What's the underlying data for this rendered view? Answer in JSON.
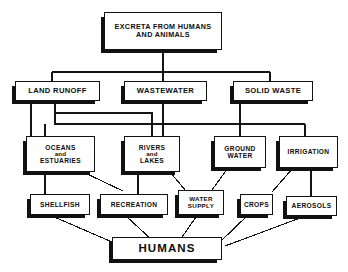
{
  "diagram": {
    "ink_color": "#111111",
    "background_color": "#ffffff",
    "levels": [
      {
        "level": 1,
        "nodes": [
          {
            "id": "excreta",
            "lines": [
              "EXCRETA FROM HUMANS",
              "AND ANIMALS"
            ]
          }
        ]
      },
      {
        "level": 2,
        "nodes": [
          {
            "id": "land_runoff",
            "lines": [
              "LAND RUNOFF"
            ]
          },
          {
            "id": "wastewater",
            "lines": [
              "WASTEWATER"
            ]
          },
          {
            "id": "solid_waste",
            "lines": [
              "SOLID WASTE"
            ]
          }
        ]
      },
      {
        "level": 3,
        "nodes": [
          {
            "id": "oceans",
            "lines": [
              "OCEANS",
              "and",
              "ESTUARIES"
            ]
          },
          {
            "id": "rivers",
            "lines": [
              "RIVERS",
              "and",
              "LAKES"
            ]
          },
          {
            "id": "ground_water",
            "lines": [
              "GROUND",
              "WATER"
            ]
          },
          {
            "id": "irrigation",
            "lines": [
              "IRRIGATION"
            ]
          }
        ]
      },
      {
        "level": 4,
        "nodes": [
          {
            "id": "shellfish",
            "lines": [
              "SHELLFISH"
            ]
          },
          {
            "id": "recreation",
            "lines": [
              "RECREATION"
            ]
          },
          {
            "id": "water_supply",
            "lines": [
              "WATER",
              "SUPPLY"
            ]
          },
          {
            "id": "crops",
            "lines": [
              "CROPS"
            ]
          },
          {
            "id": "aerosols",
            "lines": [
              "AEROSOLS"
            ]
          }
        ]
      },
      {
        "level": 5,
        "nodes": [
          {
            "id": "humans",
            "lines": [
              "HUMANS"
            ]
          }
        ]
      }
    ],
    "edges": [
      {
        "from": "excreta",
        "to": "land_runoff"
      },
      {
        "from": "excreta",
        "to": "wastewater"
      },
      {
        "from": "excreta",
        "to": "solid_waste"
      },
      {
        "from": "land_runoff",
        "to": "oceans"
      },
      {
        "from": "land_runoff",
        "to": "rivers"
      },
      {
        "from": "land_runoff",
        "to": "ground_water"
      },
      {
        "from": "land_runoff",
        "to": "irrigation"
      },
      {
        "from": "wastewater",
        "to": "rivers"
      },
      {
        "from": "solid_waste",
        "to": "ground_water"
      },
      {
        "from": "solid_waste",
        "to": "irrigation"
      },
      {
        "from": "oceans",
        "to": "shellfish"
      },
      {
        "from": "oceans",
        "to": "recreation"
      },
      {
        "from": "rivers",
        "to": "recreation"
      },
      {
        "from": "rivers",
        "to": "water_supply"
      },
      {
        "from": "ground_water",
        "to": "water_supply"
      },
      {
        "from": "irrigation",
        "to": "crops"
      },
      {
        "from": "irrigation",
        "to": "aerosols"
      },
      {
        "from": "shellfish",
        "to": "humans"
      },
      {
        "from": "recreation",
        "to": "humans"
      },
      {
        "from": "water_supply",
        "to": "humans"
      },
      {
        "from": "crops",
        "to": "humans"
      },
      {
        "from": "aerosols",
        "to": "humans"
      }
    ],
    "text": {
      "excreta_l1": "EXCRETA FROM HUMANS",
      "excreta_l2": "AND ANIMALS",
      "land_runoff": "LAND RUNOFF",
      "wastewater": "WASTEWATER",
      "solid_waste": "SOLID WASTE",
      "oceans_l1": "OCEANS",
      "oceans_l2": "and",
      "oceans_l3": "ESTUARIES",
      "rivers_l1": "RIVERS",
      "rivers_l2": "and",
      "rivers_l3": "LAKES",
      "ground_water_l1": "GROUND",
      "ground_water_l2": "WATER",
      "irrigation": "IRRIGATION",
      "shellfish": "SHELLFISH",
      "recreation": "RECREATION",
      "water_supply_l1": "WATER",
      "water_supply_l2": "SUPPLY",
      "crops": "CROPS",
      "aerosols": "AEROSOLS",
      "humans": "HUMANS"
    }
  }
}
